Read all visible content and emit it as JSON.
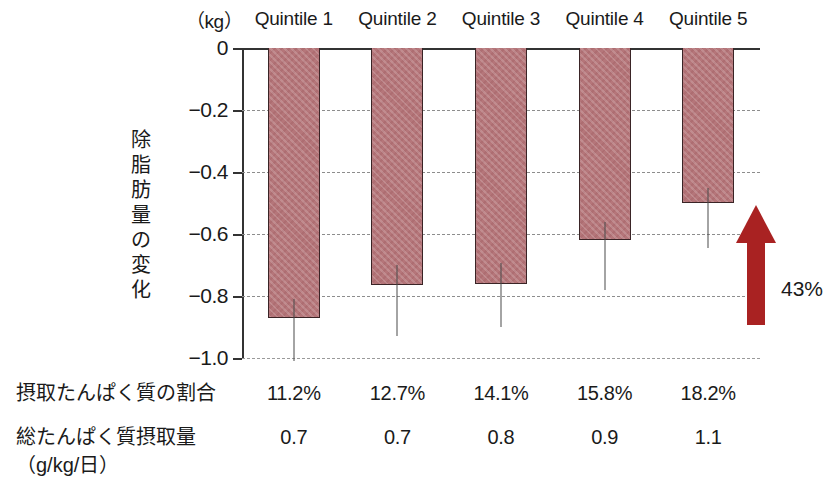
{
  "figure": {
    "unit_label": "（kg）",
    "y_axis_title_chars": [
      "除",
      "脂",
      "肪",
      "量",
      "の",
      "変",
      "化"
    ],
    "annotation_label": "43%"
  },
  "table": {
    "row1_label": "摂取たんぱく質の割合",
    "row2_label": "総たんぱく質摂取量",
    "row2_label_sub": "（g/kg/日）",
    "row1_values": [
      "11.2%",
      "12.7%",
      "14.1%",
      "15.8%",
      "18.2%"
    ],
    "row2_values": [
      "0.7",
      "0.7",
      "0.8",
      "0.9",
      "1.1"
    ]
  },
  "colors": {
    "bar_fill": "#b5767a",
    "bar_edge": "#3a2426",
    "arrow": "#a92222",
    "grid": "#8d8d8d",
    "axis": "#333333",
    "text": "#1a1a1a"
  },
  "chart_data": {
    "type": "bar",
    "title": "",
    "subtitle": "",
    "xlabel": "",
    "ylabel": "除脂肪量の変化",
    "yunit": "kg",
    "ylim": [
      -1.0,
      0
    ],
    "yticks": [
      0,
      -0.2,
      -0.4,
      -0.6,
      -0.8,
      -1.0
    ],
    "ytick_labels": [
      "0",
      "−0.2",
      "−0.4",
      "−0.6",
      "−0.8",
      "−1.0"
    ],
    "grid": true,
    "legend": "none",
    "categories": [
      "Quintile 1",
      "Quintile 2",
      "Quintile 3",
      "Quintile 4",
      "Quintile 5"
    ],
    "values": [
      -0.87,
      -0.765,
      -0.76,
      -0.62,
      -0.5
    ],
    "error_low": [
      -1.01,
      -0.93,
      -0.9,
      -0.78,
      -0.645
    ],
    "error_high": [
      -0.81,
      -0.7,
      -0.695,
      -0.56,
      -0.45
    ],
    "annotations": [
      {
        "text": "43%",
        "type": "arrow-up",
        "from_y": -0.87,
        "to_y": -0.5
      }
    ],
    "protein_percent_of_intake": [
      "11.2%",
      "12.7%",
      "14.1%",
      "15.8%",
      "18.2%"
    ],
    "total_protein_intake_g_per_kg_per_day": [
      "0.7",
      "0.7",
      "0.8",
      "0.9",
      "1.1"
    ]
  }
}
